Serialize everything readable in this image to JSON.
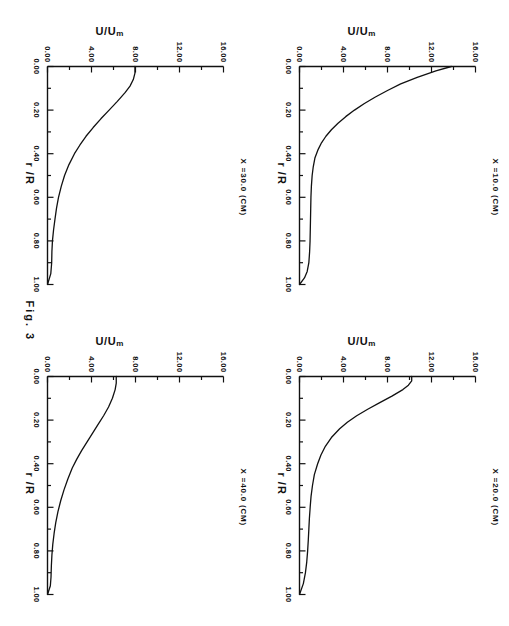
{
  "figure": {
    "caption": "Fig. 3",
    "page_number": "10"
  },
  "axes": {
    "x_label": "r /R",
    "y_label_main": "U/U",
    "y_label_sub": "m",
    "x_ticks": [
      "0.00",
      "0.20",
      "0.40",
      "0.60",
      "0.80",
      "1.00"
    ],
    "y_ticks": [
      "0.00",
      "4.00",
      "8.00",
      "12.00",
      "16.00"
    ]
  },
  "panels": [
    {
      "id": "x10",
      "title": "X  =10.0   (CM)"
    },
    {
      "id": "x20",
      "title": "X  =20.0   (CM)"
    },
    {
      "id": "x30",
      "title": "X  =30.0   (CM)"
    },
    {
      "id": "x40",
      "title": "X  =40.0   (CM)"
    }
  ],
  "chart_data": [
    {
      "type": "line",
      "title": "X  =10.0   (CM)",
      "xlabel": "r /R",
      "ylabel": "U/Um",
      "xlim": [
        0.0,
        1.0
      ],
      "ylim": [
        0.0,
        16.0
      ],
      "xticks": [
        0.0,
        0.2,
        0.4,
        0.6,
        0.8,
        1.0
      ],
      "yticks": [
        0.0,
        4.0,
        8.0,
        12.0,
        16.0
      ],
      "grid": false,
      "legend": "none",
      "series": [
        {
          "name": "U/Um",
          "x": [
            0.0,
            0.02,
            0.05,
            0.08,
            0.11,
            0.14,
            0.17,
            0.2,
            0.23,
            0.26,
            0.29,
            0.32,
            0.35,
            0.38,
            0.42,
            0.46,
            0.5,
            0.55,
            0.6,
            0.65,
            0.7,
            0.75,
            0.8,
            0.85,
            0.9,
            0.94,
            0.97,
            1.0
          ],
          "y": [
            13.8,
            12.4,
            10.7,
            9.2,
            8.0,
            6.9,
            5.9,
            5.0,
            4.2,
            3.5,
            2.9,
            2.4,
            2.0,
            1.7,
            1.4,
            1.25,
            1.15,
            1.08,
            1.04,
            1.02,
            1.0,
            0.98,
            0.96,
            0.92,
            0.85,
            0.7,
            0.45,
            0.0
          ]
        }
      ]
    },
    {
      "type": "line",
      "title": "X  =20.0   (CM)",
      "xlabel": "r /R",
      "ylabel": "U/Um",
      "xlim": [
        0.0,
        1.0
      ],
      "ylim": [
        0.0,
        16.0
      ],
      "xticks": [
        0.0,
        0.2,
        0.4,
        0.6,
        0.8,
        1.0
      ],
      "yticks": [
        0.0,
        4.0,
        8.0,
        12.0,
        16.0
      ],
      "grid": false,
      "legend": "none",
      "series": [
        {
          "name": "U/Um",
          "x": [
            0.0,
            0.02,
            0.04,
            0.06,
            0.09,
            0.12,
            0.15,
            0.18,
            0.21,
            0.24,
            0.28,
            0.32,
            0.36,
            0.4,
            0.45,
            0.5,
            0.55,
            0.6,
            0.65,
            0.7,
            0.75,
            0.8,
            0.85,
            0.9,
            0.95,
            1.0
          ],
          "y": [
            10.2,
            10.2,
            9.9,
            9.4,
            8.4,
            7.3,
            6.2,
            5.2,
            4.35,
            3.65,
            2.9,
            2.35,
            1.95,
            1.65,
            1.35,
            1.18,
            1.05,
            0.97,
            0.9,
            0.85,
            0.8,
            0.74,
            0.66,
            0.54,
            0.35,
            0.0
          ]
        }
      ]
    },
    {
      "type": "line",
      "title": "X  =30.0   (CM)",
      "xlabel": "r /R",
      "ylabel": "U/Um",
      "xlim": [
        0.0,
        1.0
      ],
      "ylim": [
        0.0,
        16.0
      ],
      "xticks": [
        0.0,
        0.2,
        0.4,
        0.6,
        0.8,
        1.0
      ],
      "yticks": [
        0.0,
        4.0,
        8.0,
        12.0,
        16.0
      ],
      "grid": false,
      "legend": "none",
      "series": [
        {
          "name": "U/Um",
          "x": [
            0.0,
            0.03,
            0.06,
            0.09,
            0.12,
            0.16,
            0.2,
            0.24,
            0.28,
            0.32,
            0.36,
            0.4,
            0.45,
            0.5,
            0.55,
            0.6,
            0.65,
            0.7,
            0.75,
            0.8,
            0.85,
            0.9,
            0.95,
            1.0
          ],
          "y": [
            7.95,
            7.95,
            7.8,
            7.5,
            7.05,
            6.35,
            5.6,
            4.85,
            4.15,
            3.5,
            2.95,
            2.45,
            1.95,
            1.55,
            1.25,
            1.0,
            0.82,
            0.68,
            0.55,
            0.45,
            0.4,
            0.38,
            0.3,
            0.0
          ]
        }
      ]
    },
    {
      "type": "line",
      "title": "X  =40.0   (CM)",
      "xlabel": "r /R",
      "ylabel": "U/Um",
      "xlim": [
        0.0,
        1.0
      ],
      "ylim": [
        0.0,
        16.0
      ],
      "xticks": [
        0.0,
        0.2,
        0.4,
        0.6,
        0.8,
        1.0
      ],
      "yticks": [
        0.0,
        4.0,
        8.0,
        12.0,
        16.0
      ],
      "grid": false,
      "legend": "none",
      "series": [
        {
          "name": "U/Um",
          "x": [
            0.0,
            0.03,
            0.06,
            0.1,
            0.14,
            0.18,
            0.22,
            0.26,
            0.3,
            0.34,
            0.38,
            0.42,
            0.47,
            0.52,
            0.57,
            0.62,
            0.67,
            0.72,
            0.77,
            0.82,
            0.87,
            0.92,
            0.96,
            1.0
          ],
          "y": [
            6.25,
            6.25,
            6.15,
            5.9,
            5.55,
            5.1,
            4.6,
            4.1,
            3.6,
            3.1,
            2.65,
            2.25,
            1.85,
            1.5,
            1.2,
            0.95,
            0.75,
            0.6,
            0.48,
            0.4,
            0.35,
            0.32,
            0.26,
            0.0
          ]
        }
      ]
    }
  ]
}
